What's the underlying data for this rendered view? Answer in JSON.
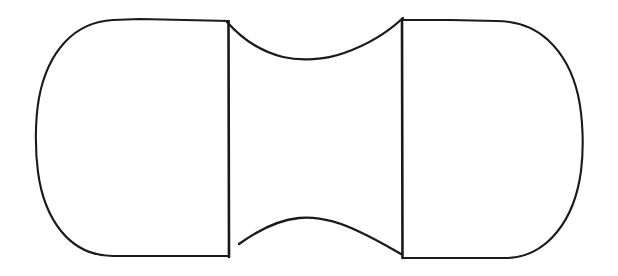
{
  "figure": {
    "title": "Bobbin outline drawing",
    "style": "hand-drawn single-weight black ink line on white background",
    "background_color": "#ffffff",
    "stroke_color": "#1a1a1a",
    "canvas": {
      "width": 618,
      "height": 276
    },
    "parts": [
      {
        "name": "left-lobe",
        "label": "Left rounded lobe"
      },
      {
        "name": "right-lobe",
        "label": "Right rounded lobe"
      },
      {
        "name": "left-flange-line",
        "label": "Left vertical flange line"
      },
      {
        "name": "right-flange-line",
        "label": "Right vertical flange line"
      },
      {
        "name": "top-waist-curve",
        "label": "Top concave waist curve"
      },
      {
        "name": "bottom-waist-curve",
        "label": "Bottom concave waist curve"
      }
    ],
    "geometry": {
      "left_lobe": {
        "leftmost_x": 35,
        "leftmost_y": 140,
        "top_y": 21,
        "bottom_y": 256,
        "flange_x": 228
      },
      "right_lobe": {
        "rightmost_x": 585,
        "rightmost_y": 150,
        "top_y": 19,
        "bottom_y": 258,
        "flange_x": 402
      },
      "top_waist": {
        "start": [
          228,
          22
        ],
        "mid": [
          312,
          59
        ],
        "end": [
          402,
          19
        ]
      },
      "bottom_waist": {
        "start": [
          240,
          244
        ],
        "mid": [
          315,
          218
        ],
        "end": [
          400,
          252
        ]
      }
    }
  }
}
